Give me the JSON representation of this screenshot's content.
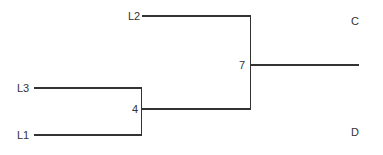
{
  "diagram": {
    "type": "dendrogram",
    "leaves": [
      {
        "id": "L2",
        "label": "L2"
      },
      {
        "id": "L3",
        "label": "L3"
      },
      {
        "id": "L1",
        "label": "L1"
      }
    ],
    "internal_nodes": [
      {
        "id": "n4",
        "label": "4",
        "children": [
          "L3",
          "L1"
        ]
      },
      {
        "id": "n7",
        "label": "7",
        "children": [
          "L2",
          "n4"
        ]
      }
    ],
    "side_labels": {
      "top_right": "C",
      "bottom_right": "D"
    },
    "line_color": "#333333",
    "text_color": "#333333"
  }
}
